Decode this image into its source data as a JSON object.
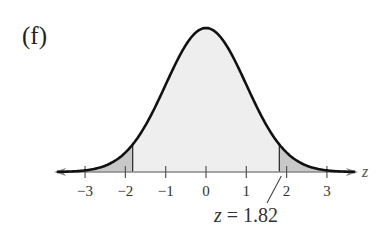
{
  "panel_label": "(f)",
  "annotation": {
    "text_var": "z",
    "text_rest": " = 1.82"
  },
  "axis_label": "z",
  "colors": {
    "curve": "#111111",
    "body_fill": "#eeeeee",
    "tail_fill": "#c8c8c8",
    "axis": "#888888"
  },
  "chart_data": {
    "type": "area",
    "title": "(f)",
    "xlabel": "z",
    "ylabel": "",
    "xlim": [
      -3.7,
      3.7
    ],
    "x_ticks": [
      -3,
      -2,
      -1,
      0,
      1,
      2,
      3
    ],
    "x_tick_labels": [
      "−3",
      "−2",
      "−1",
      "0",
      "1",
      "2",
      "3"
    ],
    "curve": "standard normal density",
    "shaded_regions": [
      {
        "name": "left tail",
        "from": -3.7,
        "to": -1.82
      },
      {
        "name": "right tail",
        "from": 1.82,
        "to": 3.7
      }
    ],
    "annotations": [
      {
        "text": "z = 1.82",
        "x": 1.82
      }
    ],
    "grid": false,
    "legend": null
  }
}
